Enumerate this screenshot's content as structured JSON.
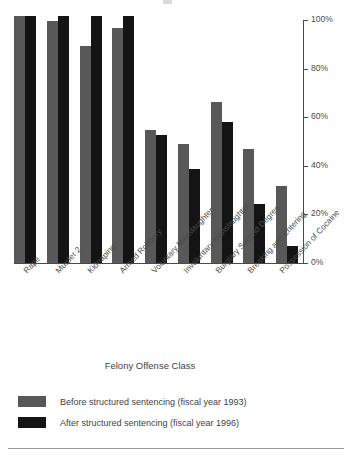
{
  "chart_data": {
    "type": "bar",
    "title": "",
    "xlabel": "Felony Offense Class",
    "ylabel": "",
    "ylim": [
      0,
      100
    ],
    "yticks": [
      0,
      20,
      40,
      60,
      80,
      100
    ],
    "ytick_labels": [
      "0%",
      "20%",
      "40%",
      "60%",
      "80%",
      "100%"
    ],
    "grid": false,
    "legend_position": "bottom-left",
    "categories": [
      "Rape",
      "Murder 2",
      "Kidnaping",
      "Armed Robbery",
      "Voluntary Manslaughter",
      "Involuntary Manslaughter",
      "Burglary Second Degree",
      "Breaking and Entering",
      "Possession of Cocaine"
    ],
    "series": [
      {
        "name": "Before structured sentencing (fiscal year 1993)",
        "color": "#585858",
        "values": [
          100,
          98,
          88,
          95,
          54,
          48,
          65,
          46,
          31
        ]
      },
      {
        "name": "After structured sentencing (fiscal year 1996)",
        "color": "#141414",
        "values": [
          100,
          100,
          100,
          100,
          52,
          38,
          57,
          24,
          7
        ]
      }
    ]
  },
  "axis": {
    "x_title": "Felony Offense Class"
  },
  "legend": {
    "items": [
      {
        "label": "Before structured sentencing (fiscal year 1993)",
        "swatch": "before"
      },
      {
        "label": "After structured sentencing (fiscal year 1996)",
        "swatch": "after"
      }
    ]
  }
}
